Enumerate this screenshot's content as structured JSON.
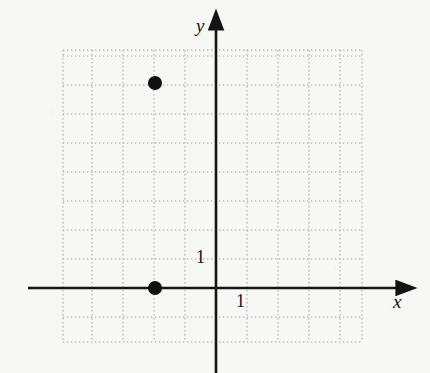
{
  "figure": {
    "kind": "coordinate-plane",
    "background_color": "#f7f7f6",
    "width": 430,
    "height": 373
  },
  "axes": {
    "x_axis": {
      "label": "x",
      "color": "#141414",
      "tick_label": "1"
    },
    "y_axis": {
      "label": "y",
      "color": "#141414",
      "tick_label": "1"
    },
    "origin_px": {
      "x": 216,
      "y": 288
    }
  },
  "grid": {
    "visible": true,
    "style": "dotted",
    "color": "#b9b9b9",
    "unit_px_x": 31,
    "unit_px_y": 29,
    "left_px": 63,
    "top_px": 50,
    "right_px": 362,
    "bottom_px": 342,
    "columns": 10,
    "rows": 10
  },
  "chart_data": {
    "type": "scatter",
    "title": "",
    "xlabel": "x",
    "ylabel": "y",
    "grid": true,
    "legend": "none",
    "xlim": [
      -5,
      5
    ],
    "ylim": [
      -2,
      8
    ],
    "xticks": [
      1
    ],
    "yticks": [
      1
    ],
    "point_color": "#101010",
    "point_radius_px": 7,
    "series": [
      {
        "name": "plotted points",
        "points": [
          {
            "x": -2,
            "y": 7,
            "px": 155,
            "py": 83
          },
          {
            "x": -2,
            "y": 0,
            "px": 155,
            "py": 288
          }
        ]
      }
    ]
  }
}
